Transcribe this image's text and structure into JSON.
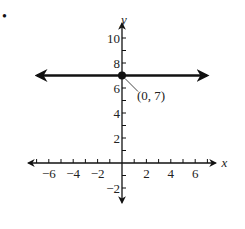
{
  "figure": {
    "bullet": "•"
  },
  "chart_data": {
    "type": "line",
    "title": "",
    "xlabel": "x",
    "ylabel": "y",
    "xlim": [
      -7.5,
      7.5
    ],
    "ylim": [
      -3,
      11
    ],
    "grid": false,
    "x_ticks": [
      -7,
      -6,
      -5,
      -4,
      -3,
      -2,
      -1,
      1,
      2,
      3,
      4,
      5,
      6,
      7
    ],
    "x_tick_labels": [
      {
        "value": -6,
        "label": "−6"
      },
      {
        "value": -4,
        "label": "−4"
      },
      {
        "value": -2,
        "label": "−2"
      },
      {
        "value": 2,
        "label": "2"
      },
      {
        "value": 4,
        "label": "4"
      },
      {
        "value": 6,
        "label": "6"
      }
    ],
    "y_ticks": [
      -2,
      -1,
      1,
      2,
      3,
      4,
      5,
      6,
      7,
      8,
      9,
      10
    ],
    "y_tick_labels": [
      {
        "value": 10,
        "label": "10"
      },
      {
        "value": 8,
        "label": "8"
      },
      {
        "value": 6,
        "label": "6"
      },
      {
        "value": 4,
        "label": "4"
      },
      {
        "value": 2,
        "label": "2"
      },
      {
        "value": -2,
        "label": "−2"
      }
    ],
    "series": [
      {
        "name": "y = 7",
        "kind": "horizontal-line",
        "x": [
          -7,
          7
        ],
        "y": [
          7,
          7
        ],
        "arrows": "both"
      }
    ],
    "points": [
      {
        "x": 0,
        "y": 7,
        "label": "(0, 7)"
      }
    ],
    "annotations": [
      {
        "text": "(0, 7)",
        "target": [
          0,
          7
        ]
      }
    ]
  }
}
